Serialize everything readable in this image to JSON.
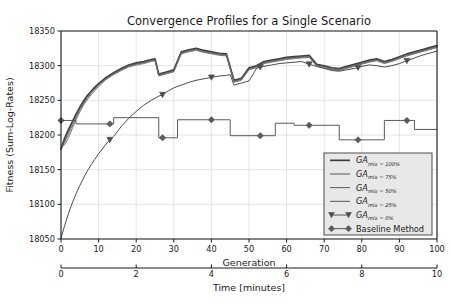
{
  "figure": {
    "title": "Convergence Profiles for a Single Scenario",
    "background_color": "#ffffff",
    "grid_color": "#d9d9d9",
    "axis_color": "#1a1a1a",
    "line_color": "#4d4d4d"
  },
  "chart_data": {
    "type": "line",
    "title": "Convergence Profiles for a Single Scenario",
    "xlabel": "Generation",
    "ylabel": "Fitness (Sum-Log-Rates)",
    "xlabel_secondary": "Time [minutes]",
    "xlim": [
      0,
      100
    ],
    "ylim": [
      18050,
      18350
    ],
    "xticks": [
      0,
      10,
      20,
      30,
      40,
      50,
      60,
      70,
      80,
      90,
      100
    ],
    "xticklabels": [
      "0",
      "10",
      "20",
      "30",
      "40",
      "50",
      "60",
      "70",
      "80",
      "90",
      "100"
    ],
    "yticks": [
      18050,
      18100,
      18150,
      18200,
      18250,
      18300,
      18350
    ],
    "yticklabels": [
      "18050",
      "18100",
      "18150",
      "18200",
      "18250",
      "18300",
      "18350"
    ],
    "xticks_secondary": [
      0,
      2,
      4,
      6,
      8,
      10
    ],
    "xticklabels_secondary": [
      "0",
      "2",
      "4",
      "6",
      "8",
      "10"
    ],
    "grid": true,
    "legend_position": "lower right",
    "series": [
      {
        "name": "GA_mix=100%",
        "label_base": "GA",
        "label_sub": "mix = 100%",
        "color": "#3d3d3d",
        "linewidth": 1.6,
        "marker": "none",
        "x": [
          0,
          1,
          2,
          3,
          4,
          5,
          6,
          7,
          8,
          9,
          10,
          12,
          14,
          16,
          18,
          20,
          22,
          24,
          25,
          26,
          28,
          30,
          32,
          34,
          36,
          38,
          40,
          42,
          44,
          46,
          48,
          50,
          52,
          54,
          56,
          58,
          60,
          62,
          64,
          66,
          68,
          70,
          72,
          74,
          76,
          78,
          80,
          82,
          84,
          86,
          88,
          90,
          92,
          94,
          96,
          98,
          100
        ],
        "y": [
          18180,
          18196,
          18208,
          18219,
          18230,
          18240,
          18249,
          18257,
          18263,
          18269,
          18274,
          18283,
          18290,
          18296,
          18301,
          18304,
          18306,
          18309,
          18310,
          18288,
          18291,
          18294,
          18320,
          18323,
          18325,
          18322,
          18320,
          18318,
          18317,
          18279,
          18282,
          18297,
          18300,
          18306,
          18308,
          18310,
          18312,
          18313,
          18314,
          18315,
          18302,
          18300,
          18297,
          18296,
          18299,
          18302,
          18305,
          18308,
          18310,
          18306,
          18309,
          18313,
          18317,
          18320,
          18323,
          18326,
          18329
        ]
      },
      {
        "name": "GA_mix=75%",
        "label_base": "GA",
        "label_sub": "mix = 75%",
        "color": "#555555",
        "linewidth": 1.0,
        "marker": "none",
        "x": [
          0,
          1,
          2,
          3,
          4,
          5,
          6,
          7,
          8,
          9,
          10,
          12,
          14,
          16,
          18,
          20,
          22,
          24,
          25,
          26,
          28,
          30,
          32,
          34,
          36,
          38,
          40,
          42,
          44,
          46,
          48,
          50,
          52,
          54,
          56,
          58,
          60,
          62,
          64,
          66,
          68,
          70,
          72,
          74,
          76,
          78,
          80,
          82,
          84,
          86,
          88,
          90,
          92,
          94,
          96,
          98,
          100
        ],
        "y": [
          18179,
          18193,
          18205,
          18217,
          18228,
          18238,
          18247,
          18255,
          18262,
          18268,
          18273,
          18282,
          18289,
          18295,
          18300,
          18303,
          18305,
          18308,
          18309,
          18287,
          18290,
          18293,
          18319,
          18322,
          18324,
          18321,
          18319,
          18317,
          18316,
          18278,
          18281,
          18296,
          18299,
          18305,
          18307,
          18309,
          18311,
          18312,
          18313,
          18314,
          18301,
          18299,
          18296,
          18295,
          18298,
          18301,
          18304,
          18307,
          18309,
          18305,
          18308,
          18312,
          18316,
          18319,
          18322,
          18325,
          18328
        ]
      },
      {
        "name": "GA_mix=50%",
        "label_base": "GA",
        "label_sub": "mix = 50%",
        "color": "#5f5f5f",
        "linewidth": 0.9,
        "marker": "none",
        "x": [
          0,
          1,
          2,
          3,
          4,
          5,
          6,
          7,
          8,
          9,
          10,
          12,
          14,
          16,
          18,
          20,
          22,
          24,
          25,
          26,
          28,
          30,
          32,
          34,
          36,
          38,
          40,
          42,
          44,
          46,
          48,
          50,
          52,
          54,
          56,
          58,
          60,
          62,
          64,
          66,
          68,
          70,
          72,
          74,
          76,
          78,
          80,
          82,
          84,
          86,
          88,
          90,
          92,
          94,
          96,
          98,
          100
        ],
        "y": [
          18180,
          18190,
          18201,
          18213,
          18225,
          18236,
          18245,
          18253,
          18260,
          18266,
          18271,
          18281,
          18288,
          18294,
          18299,
          18302,
          18304,
          18307,
          18308,
          18286,
          18289,
          18292,
          18318,
          18321,
          18323,
          18320,
          18318,
          18316,
          18315,
          18277,
          18280,
          18295,
          18298,
          18304,
          18306,
          18308,
          18310,
          18311,
          18312,
          18313,
          18300,
          18298,
          18295,
          18294,
          18297,
          18300,
          18303,
          18306,
          18308,
          18304,
          18307,
          18311,
          18315,
          18318,
          18321,
          18324,
          18327
        ]
      },
      {
        "name": "GA_mix=25%",
        "label_base": "GA",
        "label_sub": "mix = 25%",
        "color": "#6b6b6b",
        "linewidth": 0.9,
        "marker": "none",
        "x": [
          0,
          1,
          2,
          3,
          4,
          5,
          6,
          7,
          8,
          9,
          10,
          12,
          14,
          16,
          18,
          20,
          22,
          24,
          25,
          26,
          28,
          30,
          32,
          34,
          36,
          38,
          40,
          42,
          44,
          46,
          48,
          50,
          52,
          54,
          56,
          58,
          60,
          62,
          64,
          66,
          68,
          70,
          72,
          74,
          76,
          78,
          80,
          82,
          84,
          86,
          88,
          90,
          92,
          94,
          96,
          98,
          100
        ],
        "y": [
          18181,
          18186,
          18196,
          18209,
          18222,
          18233,
          18243,
          18251,
          18258,
          18264,
          18270,
          18280,
          18287,
          18293,
          18298,
          18301,
          18303,
          18306,
          18307,
          18285,
          18288,
          18291,
          18317,
          18320,
          18322,
          18319,
          18317,
          18315,
          18314,
          18276,
          18279,
          18294,
          18297,
          18303,
          18305,
          18307,
          18309,
          18310,
          18311,
          18312,
          18299,
          18297,
          18294,
          18293,
          18296,
          18299,
          18302,
          18305,
          18307,
          18303,
          18306,
          18310,
          18314,
          18317,
          18320,
          18323,
          18326
        ]
      },
      {
        "name": "GA_mix=0%",
        "label_base": "GA",
        "label_sub": "mix = 0%",
        "color": "#4d4d4d",
        "linewidth": 1.0,
        "marker": "triangle-down",
        "marker_x": [
          13,
          27,
          40,
          53,
          66,
          79,
          92
        ],
        "x": [
          0,
          1,
          2,
          3,
          4,
          5,
          6,
          7,
          8,
          9,
          10,
          12,
          13,
          14,
          16,
          18,
          20,
          22,
          24,
          25,
          26,
          27,
          28,
          30,
          32,
          34,
          36,
          38,
          40,
          42,
          44,
          45,
          46,
          48,
          50,
          52,
          53,
          54,
          56,
          58,
          60,
          62,
          64,
          66,
          68,
          70,
          72,
          74,
          76,
          78,
          79,
          80,
          82,
          84,
          86,
          88,
          90,
          92,
          94,
          96,
          98,
          100
        ],
        "y": [
          18051,
          18070,
          18087,
          18102,
          18115,
          18127,
          18138,
          18148,
          18157,
          18165,
          18173,
          18187,
          18193,
          18198,
          18212,
          18224,
          18234,
          18243,
          18250,
          18253,
          18256,
          18258,
          18262,
          18268,
          18272,
          18276,
          18279,
          18281,
          18283,
          18285,
          18286,
          18287,
          18272,
          18275,
          18278,
          18296,
          18298,
          18299,
          18301,
          18303,
          18304,
          18305,
          18306,
          18302,
          18299,
          18296,
          18293,
          18292,
          18294,
          18296,
          18297,
          18299,
          18301,
          18300,
          18298,
          18300,
          18303,
          18307,
          18311,
          18315,
          18318,
          18321
        ]
      },
      {
        "name": "Baseline Method",
        "label_base": "Baseline Method",
        "label_sub": "",
        "color": "#5a5a5a",
        "linewidth": 1.0,
        "marker": "diamond",
        "marker_x": [
          0,
          13,
          27,
          40,
          53,
          66,
          79,
          92
        ],
        "step": true,
        "x": [
          0,
          4,
          4,
          14,
          14,
          26,
          26,
          31,
          31,
          45,
          45,
          57,
          57,
          62,
          62,
          74,
          74,
          86,
          86,
          94,
          94,
          100
        ],
        "y": [
          18221,
          18221,
          18216,
          18216,
          18225,
          18225,
          18196,
          18196,
          18222,
          18222,
          18199,
          18199,
          18217,
          18217,
          18214,
          18214,
          18193,
          18193,
          18221,
          18221,
          18208,
          18208
        ]
      }
    ]
  },
  "legend": {
    "entries": [
      {
        "label_base": "GA",
        "label_sub": "mix = 100%",
        "marker": "none"
      },
      {
        "label_base": "GA",
        "label_sub": "mix = 75%",
        "marker": "none"
      },
      {
        "label_base": "GA",
        "label_sub": "mix = 50%",
        "marker": "none"
      },
      {
        "label_base": "GA",
        "label_sub": "mix = 25%",
        "marker": "none"
      },
      {
        "label_base": "GA",
        "label_sub": "mix = 0%",
        "marker": "triangle-down"
      },
      {
        "label_base": "Baseline Method",
        "label_sub": "",
        "marker": "diamond"
      }
    ]
  }
}
